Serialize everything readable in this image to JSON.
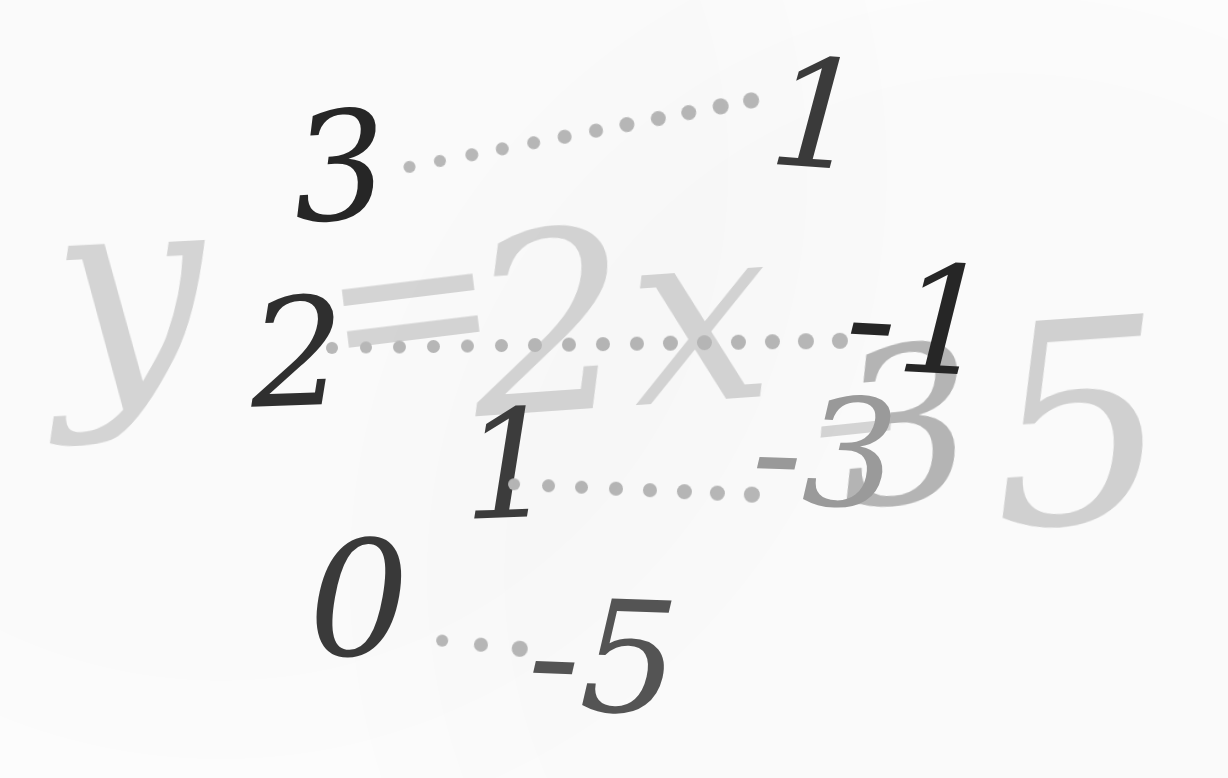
{
  "document": {
    "kind": "handwritten-math-worksheet",
    "background_color": "#fdfdfd",
    "ink_dark_color": "#2a2a2a",
    "ink_mid_color": "#9c9c9c",
    "print_light_color": "#d7d7d7",
    "dot_color": "#b9b9b9"
  },
  "equation": {
    "full_text": "y = 2x - 5",
    "y_symbol": "y",
    "equals_symbol": "=",
    "coefficient_term": "2x",
    "minus_symbol": "–",
    "hidden_three": "3",
    "constant": "5"
  },
  "value_pairs": [
    {
      "x": "3",
      "y": "1",
      "x_color": "#262626",
      "y_color": "#3b3b3b",
      "dots": 12
    },
    {
      "x": "2",
      "y": "-1",
      "x_color": "#2f2f2f",
      "y_color": "#262626",
      "dots": 16
    },
    {
      "x": "1",
      "y": "-3",
      "x_color": "#3d3d3d",
      "y_color": "#9c9c9c",
      "dots": 8
    },
    {
      "x": "0",
      "y": "-5",
      "x_color": "#3a3a3a",
      "y_color": "#555555",
      "dots": 3
    }
  ],
  "handwriting": {
    "row0_x": "3",
    "row0_y": "1",
    "row1_x": "2",
    "row1_y": "-1",
    "row2_x": "1",
    "row2_y": "-3",
    "row3_x": "0",
    "row3_y": "-5"
  }
}
